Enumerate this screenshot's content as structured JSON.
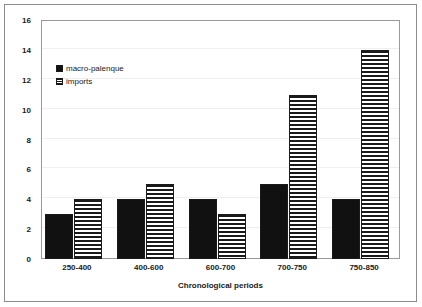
{
  "chart_data": {
    "type": "bar",
    "title": "",
    "subtitle": "",
    "xlabel": "Chronological periods",
    "ylabel": "",
    "categories": [
      "250-400",
      "400-600",
      "600-700",
      "700-750",
      "750-850"
    ],
    "series": [
      {
        "name": "macro-palenque",
        "values": [
          3,
          4,
          4,
          5,
          4
        ],
        "style": "solid-black"
      },
      {
        "name": "imports",
        "values": [
          4,
          5,
          3,
          11,
          14
        ],
        "style": "horizontal-stripes"
      }
    ],
    "ylim": [
      0,
      16
    ],
    "ytick_step": 2,
    "yticks": [
      "0",
      "2",
      "4",
      "6",
      "8",
      "10",
      "12",
      "14",
      "16"
    ],
    "grid": "horizontal-light",
    "legend_position": "inside-upper-left",
    "colors": {
      "series_solid": "#111111",
      "series_stripe": "#1a1a1a",
      "background": "#ffffff",
      "gridline": "#efefef",
      "axis": "#9a9a9a",
      "frame": "#8c8c8c",
      "text": "#1a1a1a"
    }
  },
  "legend": {
    "entries": [
      {
        "label": "macro-palenque"
      },
      {
        "label": "imports"
      }
    ]
  }
}
